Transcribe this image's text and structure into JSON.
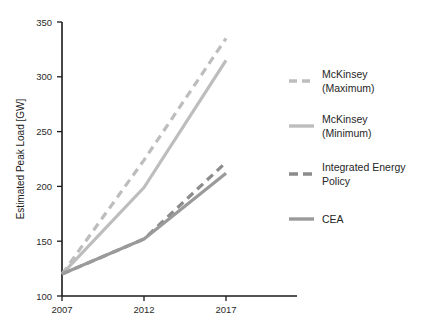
{
  "chart_data": {
    "type": "line",
    "title": "",
    "xlabel": "",
    "ylabel": "Estimated Peak Load [GW]",
    "x": [
      2007,
      2012,
      2017
    ],
    "xticklabels": [
      "2007",
      "2012",
      "2017"
    ],
    "xlim": [
      2007,
      2018.3
    ],
    "ylim": [
      100,
      350
    ],
    "yticks": [
      100,
      150,
      200,
      250,
      300,
      350
    ],
    "yticklabels": [
      "100",
      "150",
      "200",
      "250",
      "300",
      "350"
    ],
    "grid": false,
    "legend_position": "right",
    "series": [
      {
        "name": "McKinsey (Maximum)",
        "style": "dashed",
        "color": "#bdbdbd",
        "values": [
          120,
          224,
          335
        ]
      },
      {
        "name": "McKinsey (Minimum)",
        "style": "solid",
        "color": "#bdbdbd",
        "values": [
          120,
          199,
          315
        ]
      },
      {
        "name": "Integrated Energy Policy",
        "style": "dashed",
        "color": "#8c8c8c",
        "values": [
          120,
          152,
          222
        ]
      },
      {
        "name": "CEA",
        "style": "solid",
        "color": "#9a9a9a",
        "values": [
          120,
          152,
          212
        ]
      }
    ]
  },
  "axes": {
    "ylabel": "Estimated Peak Load [GW]",
    "yticks": [
      "350",
      "300",
      "250",
      "200",
      "150",
      "100"
    ],
    "xticks": [
      "2007",
      "2012",
      "2017"
    ]
  },
  "legend": {
    "items": [
      {
        "label_line1": "McKinsey",
        "label_line2": "(Maximum)"
      },
      {
        "label_line1": "McKinsey",
        "label_line2": "(Minimum)"
      },
      {
        "label_line1": "Integrated Energy",
        "label_line2": "Policy"
      },
      {
        "label_line1": "CEA",
        "label_line2": ""
      }
    ]
  },
  "colors": {
    "axis": "#1a1a1a",
    "text": "#262626",
    "mckinsey_light": "#bdbdbd",
    "policy_dark": "#8c8c8c",
    "cea_gray": "#9a9a9a",
    "background": "#ffffff"
  }
}
